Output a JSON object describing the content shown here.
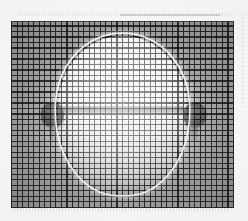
{
  "figure": {
    "kind": "structured-light-grid-projection-photograph",
    "description": "Grayscale photograph of a rounded bowl-shaped vessel with two side handles, overlaid by a projected rectangular measurement grid whose lines deform over the object's surface.",
    "background_color": "#f7f7f5",
    "grid_line_color": "#282a2c",
    "object_highlight_color": "#ffffff",
    "backdrop_color": "#a8a8a6",
    "handle_color": "#6c6c6e",
    "rim_color": "#6a6a6e"
  },
  "field": {
    "label": "projected-grid-field",
    "left_px": 11,
    "top_px": 21,
    "width_px": 223,
    "height_px": 187,
    "grid_columns": 40,
    "grid_rows": 34,
    "grid_pitch_px": 5.5
  },
  "object": {
    "label": "bowl",
    "center_x_px": 122,
    "center_y_px": 117,
    "width_px": 129,
    "height_px": 157,
    "rim_y_px": 108
  },
  "handles": [
    {
      "label": "handle-left",
      "center_x_px": 48,
      "center_y_px": 113
    },
    {
      "label": "handle-right",
      "center_x_px": 200,
      "center_y_px": 113
    }
  ],
  "artifacts": {
    "top_edge": "faint dotted scan line along the top margin",
    "right_edge": "faint dotted scan line along the right margin",
    "bottom_edge": "faint dotted scan line along the bottom margin"
  }
}
